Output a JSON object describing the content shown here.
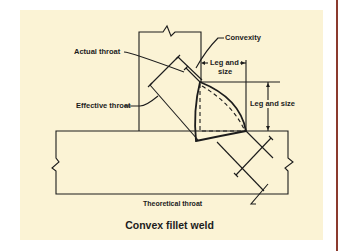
{
  "diagram": {
    "title": "Convex fillet weld",
    "labels": {
      "actual_throat": "Actual throat",
      "effective_throat": "Effective throat",
      "convexity": "Convexity",
      "leg_and_size_top_line1": "Leg and",
      "leg_and_size_top_line2": "size",
      "leg_and_size_right": "Leg and size",
      "theoretical_throat": "Theoretical throat"
    },
    "colors": {
      "background": "#fbf3d5",
      "line": "#1c1c1c",
      "border_accent": "#8b3a2e"
    }
  }
}
